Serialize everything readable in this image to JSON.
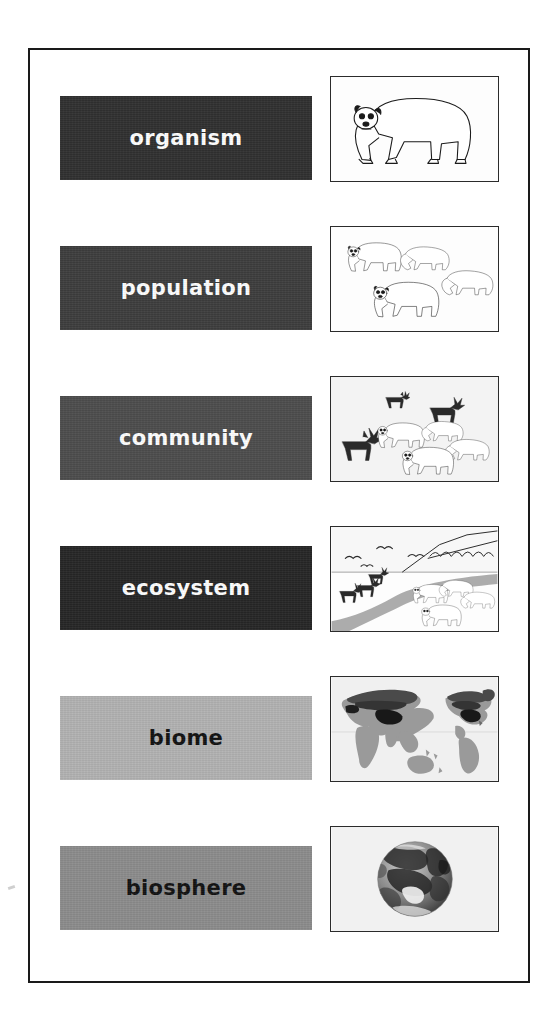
{
  "figure": {
    "border_color": "#1a1a1a",
    "background": "#ffffff"
  },
  "levels": [
    {
      "id": "organism",
      "label": "organism",
      "bar_color": "#303030",
      "text_color": "#ffffff",
      "top": 46,
      "illustration": "single-polar-bear",
      "illustration_caption": "one polar bear",
      "count_bears": 1,
      "count_caribou": 0
    },
    {
      "id": "population",
      "label": "population",
      "bar_color": "#3d3d3d",
      "text_color": "#ffffff",
      "top": 196,
      "illustration": "group-of-polar-bears",
      "illustration_caption": "four polar bears of the same species",
      "count_bears": 4,
      "count_caribou": 0
    },
    {
      "id": "community",
      "label": "community",
      "bar_color": "#4d4d4d",
      "text_color": "#ffffff",
      "top": 346,
      "illustration": "bears-and-caribou",
      "illustration_caption": "polar bears together with caribou",
      "count_bears": 4,
      "count_caribou": 3
    },
    {
      "id": "ecosystem",
      "label": "ecosystem",
      "bar_color": "#262626",
      "text_color": "#ffffff",
      "top": 496,
      "illustration": "arctic-landscape-with-animals",
      "illustration_caption": "arctic landscape with birds, mountains, river, caribou and bears",
      "count_bears": 4,
      "count_caribou": 3,
      "count_birds": 4
    },
    {
      "id": "biome",
      "label": "biome",
      "bar_color": "#b2b2b2",
      "text_color": "#111111",
      "top": 646,
      "illustration": "world-map-tundra-shaded",
      "illustration_caption": "world map with northern tundra and taiga regions shaded"
    },
    {
      "id": "biosphere",
      "label": "biosphere",
      "bar_color": "#8c8c8c",
      "text_color": "#111111",
      "top": 796,
      "illustration": "earth-globe-photo",
      "illustration_caption": "photograph of planet Earth from space"
    }
  ]
}
